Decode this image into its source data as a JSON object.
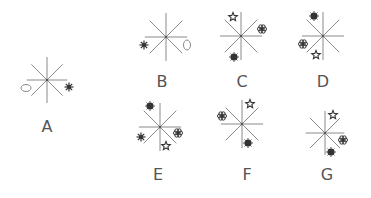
{
  "puzzle": {
    "figures": [
      {
        "id": "A",
        "label": "A",
        "center": [
          47,
          80
        ],
        "label_pos": [
          47,
          127
        ],
        "radius": 23,
        "symbols": [
          {
            "type": "moon-right",
            "pos": [
              55,
              60
            ]
          },
          {
            "type": "ellipse-horizontal",
            "pos": [
              26,
              88
            ]
          },
          {
            "type": "asterisk",
            "pos": [
              69,
              87
            ]
          }
        ]
      },
      {
        "id": "B",
        "label": "B",
        "center": [
          166,
          37
        ],
        "label_pos": [
          162,
          82
        ],
        "radius": 24,
        "symbols": [
          {
            "type": "moon-left",
            "pos": [
              158,
              15
            ]
          },
          {
            "type": "asterisk",
            "pos": [
              144,
              45
            ]
          },
          {
            "type": "ellipse-vertical",
            "pos": [
              187,
              45
            ]
          }
        ]
      },
      {
        "id": "C",
        "label": "C",
        "center": [
          241,
          36
        ],
        "label_pos": [
          242,
          82
        ],
        "radius": 24,
        "symbols": [
          {
            "type": "star",
            "pos": [
              233,
              17
            ]
          },
          {
            "type": "flower",
            "pos": [
              262,
              29
            ]
          },
          {
            "type": "sun",
            "pos": [
              234,
              57
            ]
          }
        ]
      },
      {
        "id": "D",
        "label": "D",
        "center": [
          323,
          36
        ],
        "label_pos": [
          323,
          82
        ],
        "radius": 24,
        "symbols": [
          {
            "type": "sun",
            "pos": [
              314,
              16
            ]
          },
          {
            "type": "flower",
            "pos": [
              303,
              44
            ]
          },
          {
            "type": "star",
            "pos": [
              316,
              55
            ]
          }
        ]
      },
      {
        "id": "E",
        "label": "E",
        "center": [
          160,
          127
        ],
        "label_pos": [
          158,
          175
        ],
        "radius": 24,
        "symbols": [
          {
            "type": "sun",
            "pos": [
              150,
              106
            ]
          },
          {
            "type": "asterisk",
            "pos": [
              141,
              137
            ]
          },
          {
            "type": "flower",
            "pos": [
              178,
              133
            ]
          },
          {
            "type": "star",
            "pos": [
              166,
              146
            ]
          }
        ]
      },
      {
        "id": "F",
        "label": "F",
        "center": [
          242,
          124
        ],
        "label_pos": [
          247,
          175
        ],
        "radius": 24,
        "symbols": [
          {
            "type": "star",
            "pos": [
              250,
              104
            ]
          },
          {
            "type": "flower",
            "pos": [
              222,
              116
            ]
          },
          {
            "type": "sun",
            "pos": [
              248,
              143
            ]
          }
        ]
      },
      {
        "id": "G",
        "label": "G",
        "center": [
          325,
          133
        ],
        "label_pos": [
          327,
          175
        ],
        "radius": 22,
        "symbols": [
          {
            "type": "star",
            "pos": [
              333,
              115
            ]
          },
          {
            "type": "flower",
            "pos": [
              343,
              140
            ]
          },
          {
            "type": "sun",
            "pos": [
              331,
              152
            ]
          }
        ]
      }
    ],
    "colors": {
      "lines": "#8a8a8a",
      "symbol": "#333333",
      "label": "#555555"
    }
  }
}
